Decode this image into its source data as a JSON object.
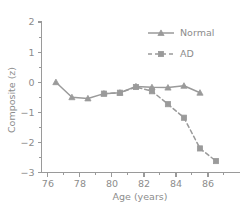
{
  "chart_data": {
    "type": "line",
    "title": "",
    "xlabel": "Age (years)",
    "ylabel": "Composite (z)",
    "xlim": [
      75.6,
      88.0
    ],
    "ylim": [
      -3,
      2
    ],
    "grid": false,
    "legend_position": "top-right",
    "x_ticks_major": [
      76,
      78,
      80,
      82,
      84,
      86
    ],
    "x_ticklabels": [
      "76",
      "78",
      "80",
      "82",
      "84",
      "86"
    ],
    "x_ticks_minor": [
      77,
      79,
      81,
      83,
      85,
      87
    ],
    "y_ticks_major": [
      -3,
      -2,
      -1,
      0,
      1,
      2
    ],
    "y_ticklabels": [
      "−3",
      "−2",
      "−1",
      "0",
      "1",
      "2"
    ],
    "y_ticks_minor": [
      -2.5,
      -1.5,
      -0.5,
      0.5,
      1.5
    ],
    "series": [
      {
        "name": "Normal",
        "linestyle": "solid",
        "marker": "triangle",
        "color": "#9a9a9a",
        "x": [
          76.5,
          77.5,
          78.5,
          79.5,
          80.5,
          81.5,
          82.5,
          83.5,
          84.5,
          85.5
        ],
        "values": [
          0.0,
          -0.5,
          -0.54,
          -0.38,
          -0.35,
          -0.14,
          -0.17,
          -0.18,
          -0.12,
          -0.35
        ]
      },
      {
        "name": "AD",
        "linestyle": "dashed",
        "marker": "square",
        "color": "#9a9a9a",
        "x": [
          79.5,
          80.5,
          81.5,
          82.5,
          83.5,
          84.5,
          85.5,
          86.5
        ],
        "values": [
          -0.38,
          -0.35,
          -0.16,
          -0.3,
          -0.73,
          -1.18,
          -2.2,
          -2.62
        ]
      }
    ]
  },
  "legend": {
    "entries": [
      {
        "label": "Normal"
      },
      {
        "label": "AD"
      }
    ]
  },
  "axes": {
    "x_title": "Age (years)",
    "y_title": "Composite (z)"
  }
}
